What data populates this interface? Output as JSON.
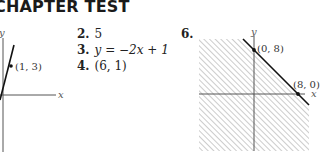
{
  "header": {
    "title": "CHAPTER TEST"
  },
  "answers": [
    {
      "number": "2.",
      "text": "5"
    },
    {
      "number": "3.",
      "text": "y = −2x + 1"
    },
    {
      "number": "4.",
      "text": "(6, 1)"
    }
  ],
  "graph1": {
    "x_axis_label": "x",
    "y_axis_label": "y",
    "point_label": "(1, 3)"
  },
  "graph6": {
    "problem_number": "6.",
    "x_axis_label": "x",
    "y_axis_label": "y",
    "points": [
      {
        "label": "(0, 8)"
      },
      {
        "label": "(8, 0)"
      }
    ]
  }
}
